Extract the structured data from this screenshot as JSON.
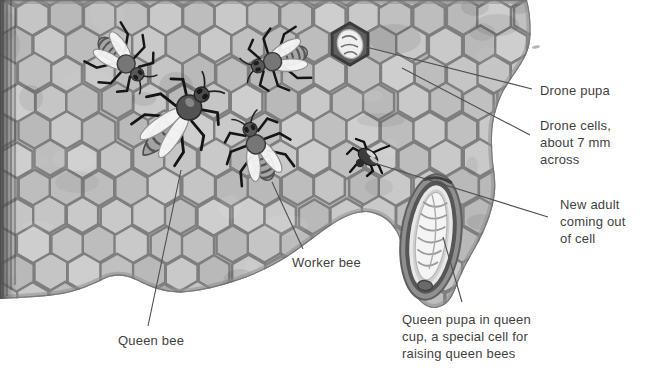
{
  "figure": {
    "background_color": "#ffffff",
    "comb_color": "#b6b6b6",
    "cell_wall_color": "#7e7e7e",
    "text_color": "#3f3f3f",
    "leader_line_color": "#4f4f4f"
  },
  "labels": [
    {
      "id": "drone-pupa",
      "lines": [
        "Drone pupa"
      ],
      "x": 540,
      "y": 82,
      "line": [
        366,
        47,
        532,
        89
      ]
    },
    {
      "id": "drone-cells",
      "lines": [
        "Drone cells,",
        "about 7 mm",
        "across"
      ],
      "x": 540,
      "y": 117,
      "line": [
        402,
        68,
        530,
        135
      ]
    },
    {
      "id": "new-adult",
      "lines": [
        "New adult",
        "coming out",
        "of cell"
      ],
      "x": 560,
      "y": 196,
      "line": [
        371,
        162,
        548,
        217
      ]
    },
    {
      "id": "queen-pupa",
      "lines": [
        "Queen pupa in queen",
        "cup, a special cell for",
        "raising queen bees"
      ],
      "x": 402,
      "y": 311,
      "line": [
        443,
        237,
        462,
        302
      ]
    },
    {
      "id": "worker-bee",
      "lines": [
        "Worker bee"
      ],
      "x": 292,
      "y": 254,
      "line": [
        272,
        182,
        303,
        249
      ]
    },
    {
      "id": "queen-bee",
      "lines": [
        "Queen bee"
      ],
      "x": 118,
      "y": 332,
      "line": [
        181,
        170,
        148,
        326
      ]
    }
  ]
}
